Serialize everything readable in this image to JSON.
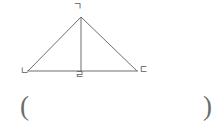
{
  "figure": {
    "type": "triangle-with-altitude",
    "stroke_color": "#6e6e6e",
    "background_color": "#ffffff",
    "vertices": {
      "apex": {
        "label": "ㄱ",
        "x": 81,
        "y": 17
      },
      "bottom_left": {
        "label": "ㄴ",
        "x": 28,
        "y": 71
      },
      "bottom_right": {
        "label": "ㄷ",
        "x": 137,
        "y": 71
      },
      "altitude_foot": {
        "label": "ㄹ",
        "x": 81,
        "y": 71
      }
    },
    "segments": [
      {
        "name": "side-left",
        "from": "bottom_left",
        "to": "apex"
      },
      {
        "name": "side-right",
        "from": "apex",
        "to": "bottom_right"
      },
      {
        "name": "base",
        "from": "bottom_left",
        "to": "bottom_right"
      },
      {
        "name": "altitude",
        "from": "apex",
        "to": "altitude_foot"
      }
    ]
  },
  "labels": {
    "apex": "ㄱ",
    "bottom_left": "ㄴ",
    "bottom_right": "ㄷ",
    "altitude_foot": "ㄹ"
  },
  "answer": {
    "open_paren": "(",
    "close_paren": ")",
    "value": ""
  }
}
